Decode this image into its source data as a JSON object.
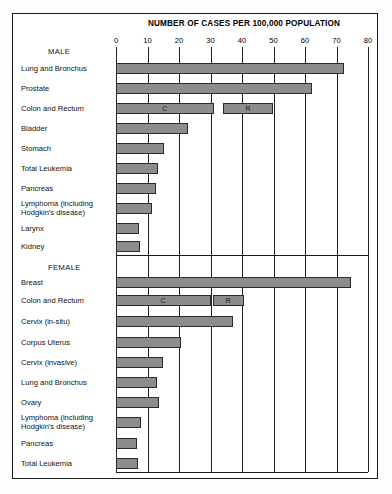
{
  "chart_data": {
    "type": "bar",
    "title": "NUMBER OF CASES PER 100,000 POPULATION",
    "xlabel": "NUMBER OF CASES PER 100,000 POPULATION",
    "ylabel": "",
    "orientation": "horizontal",
    "xlim": [
      0,
      80
    ],
    "xticks": [
      0,
      10,
      20,
      30,
      40,
      50,
      60,
      70,
      80
    ],
    "xticklabels": [
      "0",
      "10",
      "20",
      "30",
      "40",
      "50",
      "60",
      "70",
      "80"
    ],
    "grid": true,
    "legend": "none",
    "groups": [
      {
        "name": "MALE",
        "categories": [
          "Lung and Bronchus",
          "Prostate",
          "Colon and Rectum",
          "Bladder",
          "Stomach",
          "Total Leukemia",
          "Pancreas",
          "Lymphoma (including Hodgkin's disease)",
          "Larynx",
          "Kidney"
        ],
        "values": [
          72.4,
          62.2,
          50.0,
          23.0,
          15.3,
          13.4,
          12.8,
          11.5,
          7.3,
          7.7
        ],
        "split_bars": [
          {
            "category": "Colon and Rectum",
            "segments": [
              {
                "label": "C",
                "start": 0,
                "end": 31.0
              },
              {
                "label": "R",
                "start": 34.0,
                "end": 50.0
              }
            ]
          }
        ]
      },
      {
        "name": "FEMALE",
        "categories": [
          "Breast",
          "Colon and Rectum",
          "Cervix (in-situ)",
          "Corpus Uterus",
          "Cervix (invasive)",
          "Lung and Bronchus",
          "Ovary",
          "Lymphoma (including Hodgkin's disease)",
          "Pancreas",
          "Total Leukemia"
        ],
        "values": [
          74.6,
          40.5,
          37.3,
          20.7,
          15.0,
          13.0,
          13.5,
          8.0,
          6.7,
          7.0
        ],
        "split_bars": [
          {
            "category": "Colon and Rectum",
            "segments": [
              {
                "label": "C",
                "start": 0,
                "end": 30.0
              },
              {
                "label": "R",
                "start": 30.8,
                "end": 40.5
              }
            ]
          }
        ]
      }
    ],
    "annotations": [
      {
        "text": "C",
        "meaning": "Colon",
        "rows": [
          "MALE / Colon and Rectum",
          "FEMALE / Colon and Rectum"
        ]
      },
      {
        "text": "R",
        "meaning": "Rectum",
        "rows": [
          "MALE / Colon and Rectum",
          "FEMALE / Colon and Rectum"
        ]
      }
    ],
    "colors": {
      "bar_fill": "#8c8c8c",
      "bar_border": "#2b2b2b",
      "gridline": "#222222",
      "frame": "#1a1a1a",
      "text": "#111111",
      "background": "#ffffff"
    }
  },
  "rows": [
    {
      "kind": "group",
      "label": "MALE",
      "y": 47
    },
    {
      "kind": "bar",
      "label": "Lung and Bronchus",
      "y": 63,
      "value": 72.4
    },
    {
      "kind": "bar",
      "label": "Prostate",
      "y": 83,
      "value": 62.2
    },
    {
      "kind": "split",
      "label": "Colon and Rectum",
      "y": 103,
      "c_start": 0,
      "c_end": 31.0,
      "r_start": 34.0,
      "r_end": 50.0
    },
    {
      "kind": "bar",
      "label": "Bladder",
      "y": 123,
      "value": 23.0
    },
    {
      "kind": "bar",
      "label": "Stomach",
      "y": 143,
      "value": 15.3
    },
    {
      "kind": "bar",
      "label": "Total Leukemia",
      "y": 163,
      "value": 13.4
    },
    {
      "kind": "bar",
      "label": "Pancreas",
      "y": 183,
      "value": 12.8
    },
    {
      "kind": "bar2",
      "label": "Lymphoma (including",
      "label2": "Hodgkin's disease)",
      "y": 203,
      "value": 11.5
    },
    {
      "kind": "bar",
      "label": "Larynx",
      "y": 223,
      "value": 7.3
    },
    {
      "kind": "bar",
      "label": "Kidney",
      "y": 241,
      "value": 7.7
    },
    {
      "kind": "group",
      "label": "FEMALE",
      "y": 263
    },
    {
      "kind": "bar",
      "label": "Breast",
      "y": 277,
      "value": 74.6
    },
    {
      "kind": "split",
      "label": "Colon and Rectum",
      "y": 295,
      "c_start": 0,
      "c_end": 30.0,
      "r_start": 30.8,
      "r_end": 40.5
    },
    {
      "kind": "bar",
      "label": "Cervix (in-situ)",
      "y": 316,
      "value": 37.3
    },
    {
      "kind": "bar",
      "label": "Corpus Uterus",
      "y": 337,
      "value": 20.7
    },
    {
      "kind": "bar",
      "label": "Cervix (invasive)",
      "y": 357,
      "value": 15.0
    },
    {
      "kind": "bar",
      "label": "Lung and Bronchus",
      "y": 377,
      "value": 13.0
    },
    {
      "kind": "bar",
      "label": "Ovary",
      "y": 397,
      "value": 13.5
    },
    {
      "kind": "bar2",
      "label": "Lymphoma (including",
      "label2": "Hodgkin's disease)",
      "y": 417,
      "value": 8.0
    },
    {
      "kind": "bar",
      "label": "Pancreas",
      "y": 438,
      "value": 6.7
    },
    {
      "kind": "bar",
      "label": "Total Leukemia",
      "y": 458,
      "value": 7.0
    }
  ]
}
